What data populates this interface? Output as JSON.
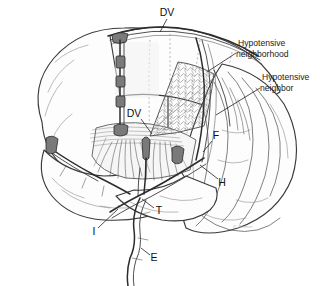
{
  "figure": {
    "background_color": "#ffffff",
    "ink_color": "#2b2b2b",
    "width": 325,
    "height": 286,
    "medium": "pen-and-ink anatomical line drawing"
  },
  "annotations": [
    {
      "id": "hypotensive-neighborhood",
      "line1": "Hypotensive",
      "line2": "neighborhood",
      "x": 238,
      "y": 44,
      "leader_from": [
        236,
        53
      ],
      "leader_to": [
        207,
        72
      ]
    },
    {
      "id": "hypotensive-neighbor",
      "line1": "Hypotensive",
      "line2": "neighbor",
      "x": 262,
      "y": 78,
      "leader_from": [
        260,
        88
      ],
      "leader_to": [
        216,
        115
      ]
    }
  ],
  "key_labels": [
    {
      "id": "dv-superior",
      "text": "DV",
      "x": 167,
      "y": 13,
      "leader_from": [
        167,
        19
      ],
      "leader_to": [
        160,
        32
      ]
    },
    {
      "id": "dv-deep",
      "text": "DV",
      "x": 134,
      "y": 114,
      "leader_from": [
        141,
        119
      ],
      "leader_to": [
        152,
        134
      ]
    },
    {
      "id": "f-frontal",
      "text": "F",
      "x": 216,
      "y": 136,
      "leader_from": [
        212,
        141
      ],
      "leader_to": [
        203,
        152
      ]
    },
    {
      "id": "h-hemisphere",
      "text": "H",
      "x": 222,
      "y": 183,
      "leader_from": [
        218,
        179
      ],
      "leader_to": [
        200,
        165
      ]
    },
    {
      "id": "t-transverse",
      "text": "T",
      "x": 159,
      "y": 211,
      "leader_from": [
        154,
        208
      ],
      "leader_to": [
        142,
        199
      ]
    },
    {
      "id": "i-internal",
      "text": "I",
      "x": 94,
      "y": 232,
      "leader_from": [
        98,
        228
      ],
      "leader_to": [
        118,
        209
      ]
    },
    {
      "id": "e-external",
      "text": "E",
      "x": 154,
      "y": 258,
      "leader_from": [
        150,
        255
      ],
      "leader_to": [
        141,
        248
      ]
    }
  ],
  "signature": {
    "text": "P. Ronner",
    "x": 233,
    "y": 228
  },
  "structures": {
    "superior_sagittal_sinus": "horizontal sinus along vertex",
    "draining_vein": "vertical draining vein descending into cortex",
    "hypotensive_wedge": "reticulated mesh wedge region",
    "cortical_veins": "branching cortical surface veins",
    "jugular_outflow": "tortuous descending outflow vessel"
  }
}
